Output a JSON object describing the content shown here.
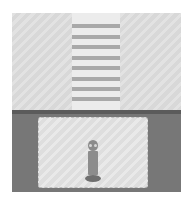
{
  "scene": {
    "name": "top-down game room",
    "colors": {
      "upper_floor": "#dcdcdc",
      "crosswalk": "#ececec",
      "stripe": "#a9a9a9",
      "dark_floor": "#777777",
      "inner_room": "#e2e2e2",
      "character": "#8a8a8a"
    },
    "crosswalk": {
      "stripe_count": 8,
      "stripe_tops": [
        24,
        35,
        45,
        56,
        66,
        77,
        87,
        97
      ]
    },
    "player": {
      "label": "player character",
      "x": 93,
      "y": 162
    }
  }
}
